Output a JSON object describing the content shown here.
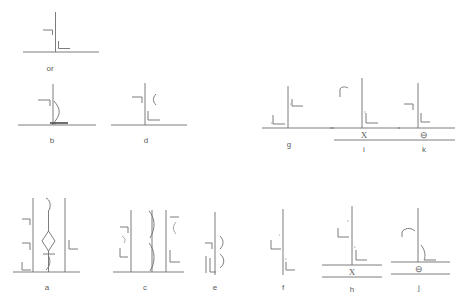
{
  "figure": {
    "background_color": "#ffffff",
    "line_color": "#6e6e6e",
    "connector_text": "or",
    "panels": [
      {
        "id": "top-alt",
        "label": "",
        "description": "Vertical member on baseline with left fillet symbol and right fillet symbol",
        "symbols": []
      },
      {
        "id": "b",
        "label": "b",
        "description": "Vertical member on baseline, left fillet symbol, curved flare weld on right, thick root pass at base",
        "symbols": []
      },
      {
        "id": "d",
        "label": "d",
        "description": "Vertical member on baseline, left fillet symbol, small arc symbol at right, lower right fillet symbol",
        "symbols": []
      },
      {
        "id": "g",
        "label": "g",
        "description": "Vertical member on baseline, upper right fillet symbol, lower left fillet symbol",
        "symbols": []
      },
      {
        "id": "i",
        "label": "i",
        "description": "Vertical member on baseline, upper left angled symbol, lower fillet symbol, tail note",
        "symbols": [
          "X"
        ]
      },
      {
        "id": "k",
        "label": "k",
        "description": "Vertical member on baseline, left fillet symbol, right fillet symbol, tail note",
        "symbols": [
          "⊖"
        ]
      },
      {
        "id": "a",
        "label": "a",
        "description": "Three vertical members with central diamond groove preparation",
        "symbols": []
      },
      {
        "id": "c",
        "label": "c",
        "description": "Three vertical members with central bevel preparations, outer fillet symbols",
        "symbols": []
      },
      {
        "id": "e",
        "label": "e",
        "description": "Single vertical member with left fillet symbols and right curved flare symbols",
        "symbols": []
      },
      {
        "id": "f",
        "label": "f",
        "description": "Single vertical member with left fillet symbol and lower right fillet symbol",
        "symbols": []
      },
      {
        "id": "h",
        "label": "h",
        "description": "Vertical member on baseline, left fillet symbol, lower fillet symbol, tail note",
        "symbols": [
          "X"
        ]
      },
      {
        "id": "j",
        "label": "j",
        "description": "Vertical member on baseline, left flare symbol, lower right fillet symbol, tail note",
        "symbols": [
          "⊖"
        ]
      }
    ]
  }
}
